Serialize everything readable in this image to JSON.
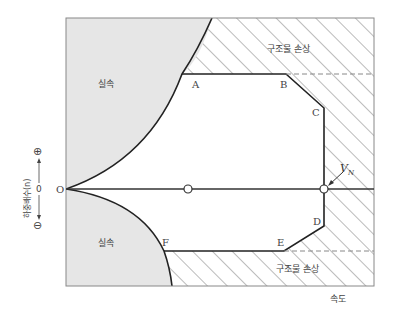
{
  "diagram": {
    "regions": {
      "stall_upper": "실속",
      "stall_lower": "실속",
      "structural_damage_upper": "구조물 손상",
      "structural_damage_lower": "구조물 손상"
    },
    "points": {
      "origin": "O",
      "A": "A",
      "B": "B",
      "C": "C",
      "D": "D",
      "E": "E",
      "F": "F",
      "vn": "V",
      "vn_sub": "N"
    },
    "axes": {
      "x_label": "속도",
      "y_label": "하중배수(n)",
      "y_zero": "0",
      "y_positive": "⊕",
      "y_negative": "⊖"
    },
    "colors": {
      "stall_fill": "#e6e6e6",
      "line": "#222222",
      "hatch": "#777777",
      "frame": "#888888"
    }
  }
}
